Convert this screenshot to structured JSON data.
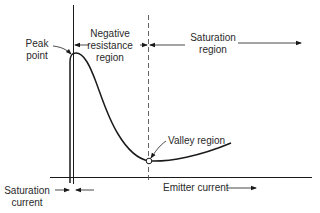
{
  "diagram": {
    "type": "ujt-emitter-characteristic",
    "labels": {
      "peak_line1": "Peak",
      "peak_line2": "point",
      "negres_line1": "Negative",
      "negres_line2": "resistance",
      "negres_line3": "region",
      "sat_region_line1": "Saturation",
      "sat_region_line2": "region",
      "valley": "Valley region",
      "emitter_current": "Emitter current",
      "sat_current_line1": "Saturation",
      "sat_current_line2": "current"
    },
    "colors": {
      "line": "#1a1a1a",
      "background": "#ffffff"
    }
  }
}
